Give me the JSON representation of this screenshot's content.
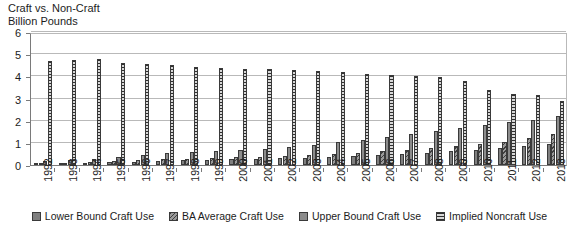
{
  "title": {
    "line1": "Craft vs. Non-Craft",
    "line2": "Billion Pounds"
  },
  "legend": [
    {
      "label": "Lower Bound Craft Use",
      "pattern": "solid-dark-gray",
      "color": "#7f7f7f"
    },
    {
      "label": "BA Average Craft Use",
      "pattern": "diagonal-hatch",
      "color": "#9a9a9a"
    },
    {
      "label": "Upper Bound Craft Use",
      "pattern": "solid-gray",
      "color": "#8c8c8c"
    },
    {
      "label": "Implied Noncraft Use",
      "pattern": "horizontal-stripes",
      "color": "#d8d8d8"
    }
  ],
  "axis": {
    "y_ticks": [
      "6",
      "5",
      "4",
      "3",
      "2",
      "1",
      "0"
    ],
    "y_values": [
      6,
      5,
      4,
      3,
      2,
      1,
      0
    ]
  },
  "chart_data": {
    "type": "bar",
    "title": "Craft vs. Non-Craft Billion Pounds",
    "xlabel": "",
    "ylabel": "Billion Pounds",
    "ylim": [
      0,
      6
    ],
    "ytick_step": 1,
    "grid": true,
    "legend_position": "bottom",
    "categories": [
      "1992",
      "1993",
      "1994",
      "1995",
      "1996",
      "1997",
      "1998",
      "1999",
      "2000",
      "2001",
      "2002",
      "2003",
      "2004",
      "2005",
      "2006",
      "2007",
      "2008",
      "2009",
      "2010",
      "2011",
      "2012",
      "2013"
    ],
    "series": [
      {
        "name": "Lower Bound Craft Use",
        "values": [
          0.06,
          0.07,
          0.09,
          0.12,
          0.15,
          0.18,
          0.21,
          0.23,
          0.25,
          0.27,
          0.3,
          0.33,
          0.37,
          0.41,
          0.45,
          0.5,
          0.56,
          0.62,
          0.68,
          0.76,
          0.85,
          0.97
        ]
      },
      {
        "name": "BA Average Craft Use",
        "values": [
          0.08,
          0.1,
          0.13,
          0.17,
          0.21,
          0.25,
          0.28,
          0.31,
          0.34,
          0.37,
          0.41,
          0.45,
          0.5,
          0.56,
          0.62,
          0.69,
          0.77,
          0.85,
          0.95,
          1.06,
          1.2,
          1.38
        ]
      },
      {
        "name": "Upper Bound Craft Use",
        "values": [
          0.17,
          0.22,
          0.28,
          0.37,
          0.45,
          0.52,
          0.58,
          0.63,
          0.68,
          0.74,
          0.82,
          0.92,
          1.02,
          1.14,
          1.26,
          1.4,
          1.55,
          1.68,
          1.82,
          1.95,
          2.05,
          2.2
        ]
      },
      {
        "name": "Implied Noncraft Use",
        "values": [
          4.7,
          4.72,
          4.78,
          4.6,
          4.55,
          4.5,
          4.4,
          4.38,
          4.35,
          4.32,
          4.3,
          4.22,
          4.18,
          4.12,
          4.08,
          4.02,
          3.95,
          3.78,
          3.4,
          3.22,
          3.18,
          2.9
        ]
      }
    ]
  }
}
